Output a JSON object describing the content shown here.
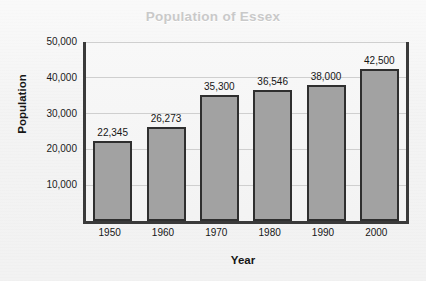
{
  "chart_data": {
    "type": "bar",
    "title": "Population of Essex",
    "xlabel": "Year",
    "ylabel": "Population",
    "categories": [
      "1950",
      "1960",
      "1970",
      "1980",
      "1990",
      "2000"
    ],
    "values": [
      22345,
      26273,
      35300,
      36546,
      38000,
      42500
    ],
    "value_labels": [
      "22,345",
      "26,273",
      "35,300",
      "36,546",
      "38,000",
      "42,500"
    ],
    "ylim": [
      0,
      50000
    ],
    "yticks": [
      10000,
      20000,
      30000,
      40000,
      50000
    ],
    "ytick_labels": [
      "10,000",
      "20,000",
      "30,000",
      "40,000",
      "50,000"
    ],
    "grid": "horizontal",
    "legend": "none",
    "series": [
      {
        "name": "Population",
        "values": [
          22345,
          26273,
          35300,
          36546,
          38000,
          42500
        ]
      }
    ]
  },
  "style": {
    "bar_fill": "#a2a2a2",
    "bar_edge": "#2f2f2f",
    "axis_color": "#3a3a3a",
    "gridline_color": "#cfcfcf",
    "title_color": "#c9c9c9",
    "text_color": "#161616",
    "background": "#f3f3f3"
  }
}
